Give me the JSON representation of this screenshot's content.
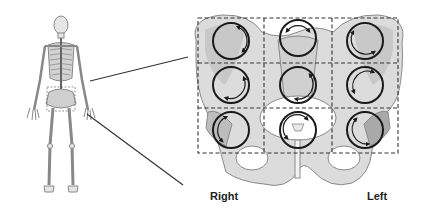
{
  "figure": {
    "labels": {
      "right": "Right",
      "left": "Left"
    },
    "colors": {
      "bone_fill": "#dcdcdc",
      "bone_shade": "#bdbdbd",
      "bone_outline": "#8a8a8a",
      "grid_line": "#333333",
      "circle_stroke": "#1a1a1a",
      "connector_line": "#333333",
      "background": "#ffffff"
    },
    "grid": {
      "rows": 3,
      "cols": 3,
      "style": "dashed"
    },
    "regions": [
      {
        "row": 0,
        "col": 0,
        "side": "right",
        "arrows": "clockwise"
      },
      {
        "row": 0,
        "col": 1,
        "side": "center",
        "arrows": "bidirectional"
      },
      {
        "row": 0,
        "col": 2,
        "side": "left",
        "arrows": "counterclockwise"
      },
      {
        "row": 1,
        "col": 0,
        "side": "right",
        "arrows": "clockwise"
      },
      {
        "row": 1,
        "col": 1,
        "side": "center",
        "arrows": "clockwise"
      },
      {
        "row": 1,
        "col": 2,
        "side": "left",
        "arrows": "counterclockwise"
      },
      {
        "row": 2,
        "col": 0,
        "side": "right",
        "arrows": "counterclockwise"
      },
      {
        "row": 2,
        "col": 1,
        "side": "center",
        "arrows": "bidirectional"
      },
      {
        "row": 2,
        "col": 2,
        "side": "left",
        "arrows": "counterclockwise"
      }
    ],
    "icons": {
      "skeleton": "full-skeleton-icon",
      "pelvis": "pelvis-icon"
    }
  }
}
